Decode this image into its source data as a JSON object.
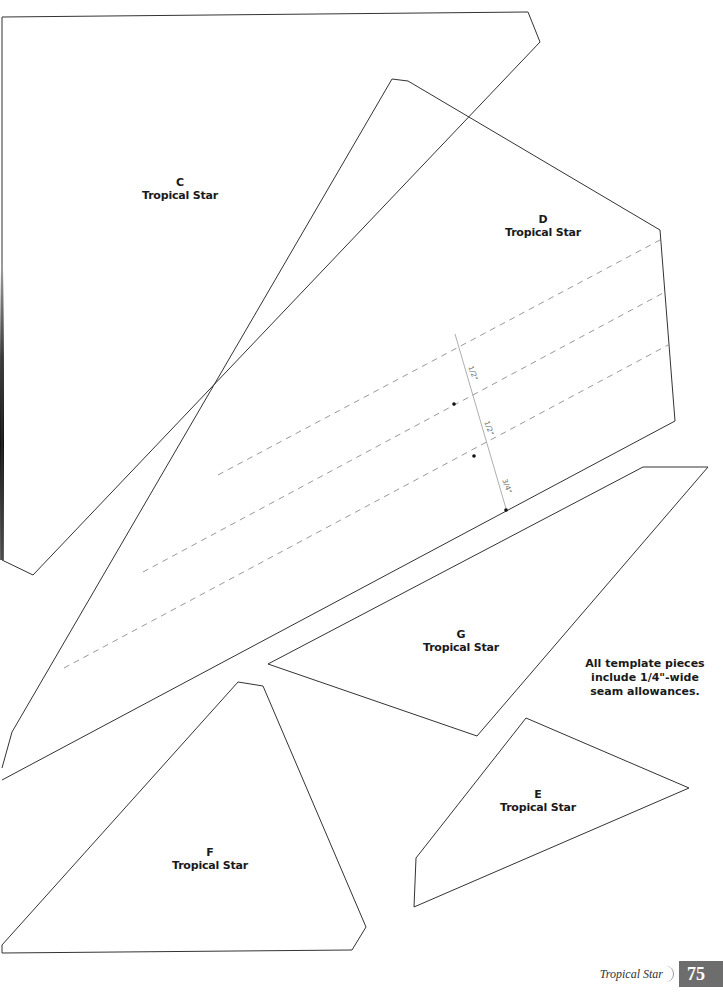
{
  "pieces": [
    {
      "letter": "C",
      "name": "Tropical Star"
    },
    {
      "letter": "D",
      "name": "Tropical Star"
    },
    {
      "letter": "G",
      "name": "Tropical Star"
    },
    {
      "letter": "F",
      "name": "Tropical Star"
    },
    {
      "letter": "E",
      "name": "Tropical Star"
    }
  ],
  "measurements": [
    "1/2\"",
    "1/2\"",
    "3/4\""
  ],
  "note": {
    "line1": "All template pieces",
    "line2": "include 1/4\"-wide",
    "line3": "seam allowances."
  },
  "footer": {
    "title": "Tropical Star",
    "page_number": "75",
    "page_box_color": "#6d6d6d"
  },
  "colors": {
    "outline": "#333333",
    "dashed": "#999999",
    "text": "#1a1a1a"
  }
}
